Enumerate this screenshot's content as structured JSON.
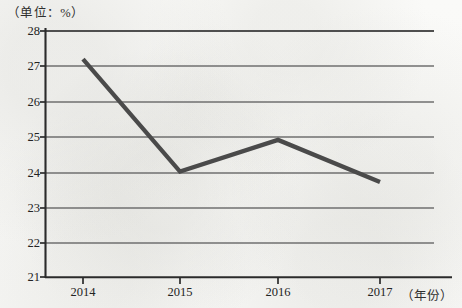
{
  "chart_data": {
    "type": "line",
    "title": "（单位：%）",
    "xlabel": "（年份）",
    "ylabel": "",
    "categories": [
      "2014",
      "2015",
      "2016",
      "2017"
    ],
    "values": [
      27.2,
      24.0,
      24.9,
      23.7
    ],
    "series": [
      {
        "name": "",
        "values": [
          27.2,
          24.0,
          24.9,
          23.7
        ]
      }
    ],
    "ylim": [
      21,
      28
    ],
    "yticks": [
      21,
      22,
      23,
      24,
      25,
      26,
      27,
      28
    ],
    "ytick_labels": [
      "21",
      "22",
      "23",
      "24",
      "25",
      "26",
      "27",
      "28"
    ],
    "xtick_labels": [
      "2014",
      "2015",
      "2016",
      "2017"
    ],
    "grid": true,
    "grid_axis": "y",
    "legend": false,
    "legend_position": "none",
    "line_color": "#4a4a4a",
    "grid_color": "#6f6f6f",
    "axis_color": "#2b2b2b",
    "background_color": "#fbfbfa",
    "annotations": []
  },
  "labels": {
    "unit_title": "（单位：%）",
    "year_caption": "（年份）"
  }
}
